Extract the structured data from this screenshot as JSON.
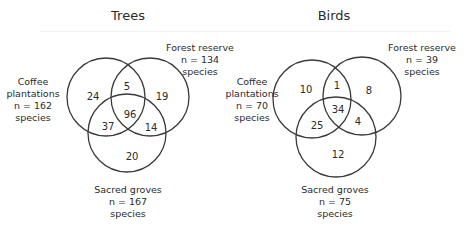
{
  "panels": [
    {
      "title": "Trees",
      "sets": {
        "coffee": {
          "name_line1": "Coffee",
          "name_line2": "plantations",
          "n": "n = 162",
          "unit": "species"
        },
        "forest": {
          "name": "Forest reserve",
          "n": "n = 134",
          "unit": "species"
        },
        "sacred": {
          "name": "Sacred groves",
          "n": "n = 167",
          "unit": "species"
        }
      },
      "regions": {
        "coffee_only": "24",
        "coffee_forest": "5",
        "forest_only": "19",
        "all_three": "96",
        "coffee_sacred": "37",
        "forest_sacred": "14",
        "sacred_only": "20"
      }
    },
    {
      "title": "Birds",
      "sets": {
        "coffee": {
          "name_line1": "Coffee",
          "name_line2": "plantations",
          "n": "n = 70",
          "unit": "species"
        },
        "forest": {
          "name": "Forest reserve",
          "n": "n = 39",
          "unit": "species"
        },
        "sacred": {
          "name": "Sacred groves",
          "n": "n = 75",
          "unit": "species"
        }
      },
      "regions": {
        "coffee_only": "10",
        "coffee_forest": "1",
        "forest_only": "8",
        "all_three": "34",
        "coffee_sacred": "25",
        "forest_sacred": "4",
        "sacred_only": "12"
      }
    }
  ],
  "colors": {
    "background": "#ffffff",
    "stroke": "#3a3a3a",
    "text": "#2b2b2b"
  }
}
